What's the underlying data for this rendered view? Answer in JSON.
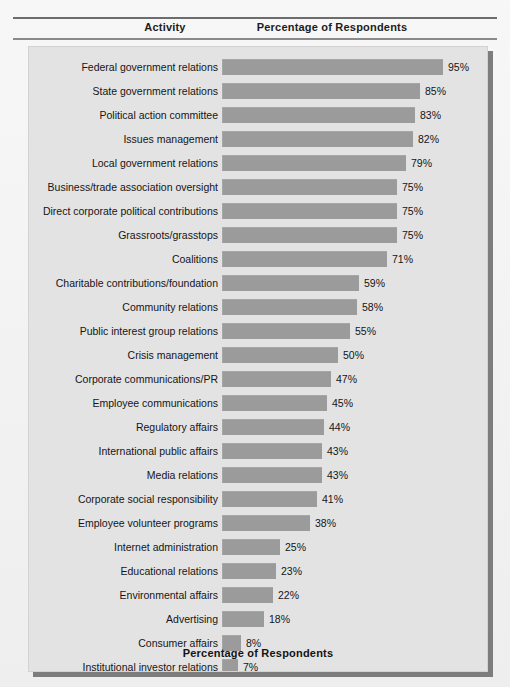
{
  "header": {
    "activity_label": "Activity",
    "percentage_label": "Percentage of Respondents"
  },
  "footer": {
    "axis_caption": "Percentage of Respondents"
  },
  "colors": {
    "bar": "#9b9b9b",
    "panel_background": "#e3e3e3",
    "page_background": "#f3f3f3",
    "text": "#151515"
  },
  "chart_data": {
    "type": "bar",
    "orientation": "horizontal",
    "title": "",
    "xlabel": "Percentage of Respondents",
    "ylabel": "Activity",
    "xlim": [
      0,
      100
    ],
    "grid": false,
    "legend": null,
    "value_suffix": "%",
    "categories": [
      "Federal government relations",
      "State government relations",
      "Political action committee",
      "Issues management",
      "Local government relations",
      "Business/trade association oversight",
      "Direct corporate political contributions",
      "Grassroots/grasstops",
      "Coalitions",
      "Charitable contributions/foundation",
      "Community relations",
      "Public interest group relations",
      "Crisis management",
      "Corporate communications/PR",
      "Employee communications",
      "Regulatory affairs",
      "International public affairs",
      "Media relations",
      "Corporate social responsibility",
      "Employee volunteer programs",
      "Internet administration",
      "Educational relations",
      "Environmental affairs",
      "Advertising",
      "Consumer affairs",
      "Institutional investor relations",
      "Stockholder relations",
      "Other"
    ],
    "values": [
      95,
      85,
      83,
      82,
      79,
      75,
      75,
      75,
      71,
      59,
      58,
      55,
      50,
      47,
      45,
      44,
      43,
      43,
      41,
      38,
      25,
      23,
      22,
      18,
      8,
      7,
      7,
      7
    ],
    "labels": [
      "95%",
      "85%",
      "83%",
      "82%",
      "79%",
      "75%",
      "75%",
      "75%",
      "71%",
      "59%",
      "58%",
      "55%",
      "50%",
      "47%",
      "45%",
      "44%",
      "43%",
      "43%",
      "41%",
      "38%",
      "25%",
      "23%",
      "22%",
      "18%",
      "8%",
      "7%",
      "7%",
      "7%"
    ]
  }
}
